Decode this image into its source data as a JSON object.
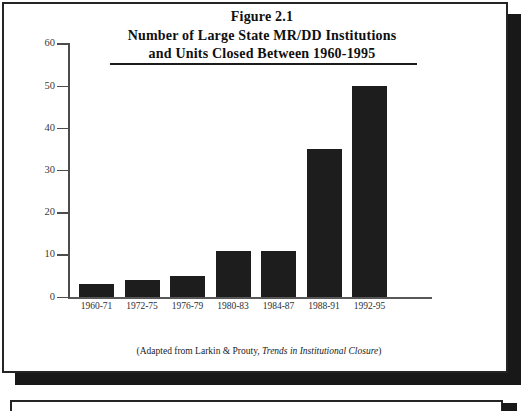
{
  "figure": {
    "title_lines": [
      "Figure 2.1",
      "Number of Large State MR/DD Institutions",
      "and Units Closed Between 1960-1995"
    ],
    "caption": {
      "prefix": "(Adapted from Larkin & Prouty, ",
      "italic": "Trends in Institutional Closure",
      "suffix": ")"
    }
  },
  "chart_data": {
    "type": "bar",
    "categories": [
      "1960-71",
      "1972-75",
      "1976-79",
      "1980-83",
      "1984-87",
      "1988-91",
      "1992-95"
    ],
    "values": [
      3,
      4,
      5,
      11,
      11,
      35,
      50
    ],
    "xlabel": "",
    "ylabel": "",
    "ylim": [
      0,
      60
    ],
    "yticks": [
      0,
      10,
      20,
      30,
      40,
      50,
      60
    ],
    "grid": false,
    "legend": false,
    "bar_color": "#1d1d1d",
    "source_note": "(Adapted from Larkin & Prouty, Trends in Institutional Closure)"
  },
  "colors": {
    "bar": "#1d1d1d",
    "frame_border": "#242424",
    "drop_shadow": "#181818",
    "axis": "#4c4c4c",
    "background": "#ffffff"
  }
}
